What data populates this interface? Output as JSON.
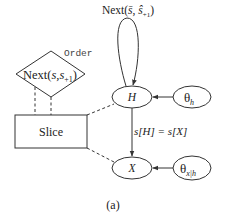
{
  "diagram": {
    "caption": "(a)",
    "order_factor": {
      "label_main": "Next(",
      "label_args": "s,s",
      "label_sub": "+1",
      "label_close": ")",
      "annotation": "Order"
    },
    "slice_box": {
      "label": "Slice"
    },
    "self_loop": {
      "label_main": "Next(",
      "label_arg1": "s̄",
      "label_sep": ", ",
      "label_arg2": "ŝ",
      "label_sub": "+1",
      "label_close": ")"
    },
    "nodes": {
      "hidden": {
        "label": "H"
      },
      "theta_h": {
        "label": "θ",
        "sub": "h"
      },
      "observed": {
        "label": "X"
      },
      "theta_x": {
        "label": "θ",
        "sub": "x|h"
      }
    },
    "edge_labels": {
      "h_to_x": "s[H] = s[X]"
    },
    "colors": {
      "stroke": "#333333",
      "text": "#222222",
      "background": "#ffffff"
    }
  }
}
